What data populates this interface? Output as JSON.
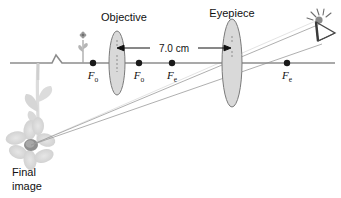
{
  "figure": {
    "type": "optics-ray-diagram"
  },
  "labels": {
    "objective": "Objective",
    "eyepiece": "Eyepiece",
    "final_image_line1": "Final",
    "final_image_line2": "image",
    "separation": "7.0 cm"
  },
  "focal_points": [
    {
      "id": "fo-left",
      "symbol": "F",
      "subscript": "o",
      "x": 93,
      "y": 63
    },
    {
      "id": "fo-right",
      "symbol": "F",
      "subscript": "o",
      "x": 139,
      "y": 63
    },
    {
      "id": "fe-left",
      "symbol": "F",
      "subscript": "e",
      "x": 172,
      "y": 63
    },
    {
      "id": "fe-right",
      "symbol": "F",
      "subscript": "e",
      "x": 287,
      "y": 63
    }
  ],
  "lenses": [
    {
      "id": "objective-lens",
      "cx": 117,
      "cy": 63,
      "rx": 8,
      "ry": 32
    },
    {
      "id": "eyepiece-lens",
      "cx": 232,
      "cy": 63,
      "rx": 10,
      "ry": 44
    }
  ],
  "axis": {
    "y": 63,
    "x_start": 10,
    "x_end": 335
  },
  "icons": {
    "eye": "eye-icon",
    "object_flower": "small-flower-object-icon",
    "image_flower": "large-flower-image-icon",
    "axis_break": "axis-break-zigzag-icon"
  },
  "colors": {
    "axis": "#8c8c8c",
    "lens_fill": "#d9d9d9",
    "lens_stroke": "#7a7a7a",
    "ray": "#9a9a9a",
    "dot": "#1a1a1a",
    "flower_light": "#dedede",
    "flower_mid": "#c6c6c6",
    "flower_center": "#8a8a8a",
    "text": "#111111"
  }
}
